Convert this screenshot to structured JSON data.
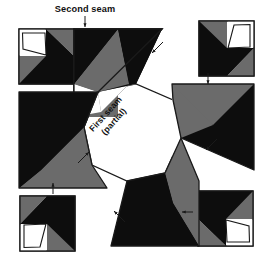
{
  "figure": {
    "kind": "quilt-block-assembly-diagram",
    "title_visible": false,
    "background_color": "#ffffff",
    "outline_color": "#1a1a1a",
    "fabric_colors": {
      "dark": "#0d0d0d",
      "medium": "#6b6b6b",
      "light": "#ffffff"
    }
  },
  "labels": {
    "second_seam": "Second seam",
    "first_seam_line1": "First seam",
    "first_seam_line2": "(partial)"
  },
  "annotations": {
    "arrows": [
      {
        "name": "arrow-second-seam-top",
        "direction": "down",
        "x": 85,
        "y": 19
      },
      {
        "name": "arrow-top-right-diagonal",
        "direction": "down-left",
        "x": 157,
        "y": 48
      },
      {
        "name": "arrow-right-block",
        "direction": "down",
        "x": 208,
        "y": 79
      },
      {
        "name": "arrow-right-diagonal",
        "direction": "down-left",
        "x": 211,
        "y": 145
      },
      {
        "name": "arrow-bottom-right-block",
        "direction": "left",
        "x": 186,
        "y": 212
      },
      {
        "name": "arrow-bottom-diagonal",
        "direction": "up-left",
        "x": 118,
        "y": 215
      },
      {
        "name": "arrow-bottom-left-block",
        "direction": "up",
        "x": 53,
        "y": 187
      },
      {
        "name": "arrow-left-diagonal",
        "direction": "up-right",
        "x": 84,
        "y": 157
      }
    ],
    "arrow_count": 8
  },
  "units": [
    {
      "name": "corner-block-top-left",
      "rotation_deg": 0,
      "description": "square pinwheel block: dark, medium and light triangles"
    },
    {
      "name": "corner-block-top-right",
      "rotation_deg": 90,
      "description": "square pinwheel block: dark, medium and light triangles"
    },
    {
      "name": "corner-block-bottom-right",
      "rotation_deg": 180,
      "description": "square pinwheel block: dark, medium and light triangles"
    },
    {
      "name": "corner-block-bottom-left",
      "rotation_deg": 270,
      "description": "square pinwheel block: dark, medium and light triangles"
    },
    {
      "name": "side-unit-top",
      "rotation_deg": 0,
      "description": "large right triangle, dark with medium triangle"
    },
    {
      "name": "side-unit-right",
      "rotation_deg": 90,
      "description": "large right triangle, dark with medium triangle"
    },
    {
      "name": "side-unit-bottom",
      "rotation_deg": 180,
      "description": "large right triangle, dark with medium triangle"
    },
    {
      "name": "side-unit-left",
      "rotation_deg": 270,
      "description": "large right triangle, dark with medium triangle"
    },
    {
      "name": "center-octagon",
      "rotation_deg": 0,
      "description": "light octagonal center patch"
    }
  ]
}
